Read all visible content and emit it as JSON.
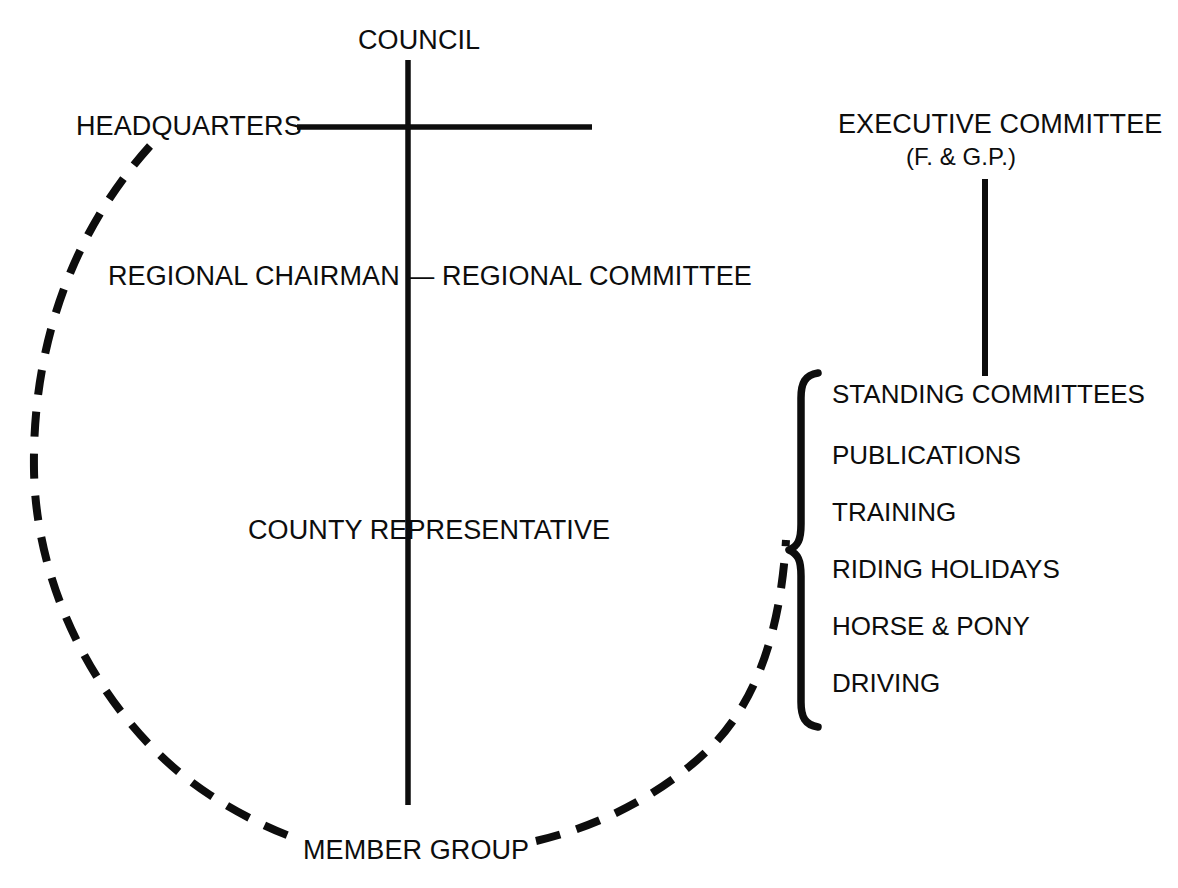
{
  "diagram": {
    "background_color": "#ffffff",
    "line_color": "#0d0d0d",
    "nodes": {
      "council": "COUNCIL",
      "headquarters": "HEADQUARTERS",
      "executive_committee": "EXECUTIVE COMMITTEE",
      "executive_committee_sub": "(F. & G.P.)",
      "regional": "REGIONAL CHAIRMAN — REGIONAL COMMITTEE",
      "county_representative": "COUNTY REPRESENTATIVE",
      "member_group": "MEMBER GROUP"
    },
    "standing_committees": [
      "STANDING COMMITTEES",
      "PUBLICATIONS",
      "TRAINING",
      "RIDING HOLIDAYS",
      "HORSE & PONY",
      "DRIVING"
    ],
    "connectors": {
      "council_vertical": "solid",
      "council_horizontal": "solid",
      "executive_vertical": "solid",
      "member_group_vertical": "solid",
      "headquarters_to_member_group": "dashed-arc",
      "member_group_to_committees": "dashed-arc",
      "committee_brace": "curly-brace"
    }
  }
}
